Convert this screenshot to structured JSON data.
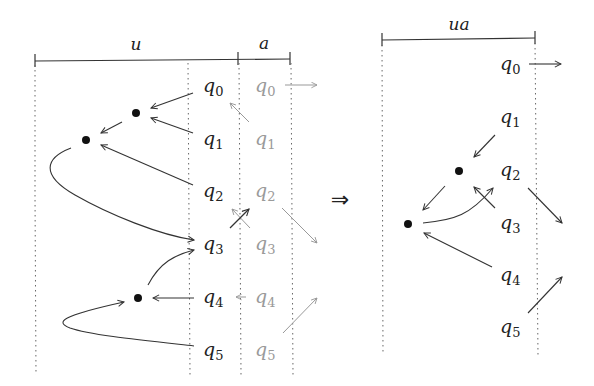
{
  "left_diagram": {
    "segments": [
      {
        "label": "u",
        "x1": 35,
        "x2": 238
      },
      {
        "label": "a",
        "x1": 238,
        "x2": 290
      }
    ],
    "states_u": [
      {
        "name": "q",
        "sub": "0",
        "x": 203,
        "y": 87
      },
      {
        "name": "q",
        "sub": "1",
        "x": 203,
        "y": 140
      },
      {
        "name": "q",
        "sub": "2",
        "x": 203,
        "y": 193
      },
      {
        "name": "q",
        "sub": "3",
        "x": 203,
        "y": 245
      },
      {
        "name": "q",
        "sub": "4",
        "x": 203,
        "y": 298
      },
      {
        "name": "q",
        "sub": "5",
        "x": 203,
        "y": 351
      }
    ],
    "states_a": [
      {
        "name": "q",
        "sub": "0",
        "x": 255,
        "y": 87
      },
      {
        "name": "q",
        "sub": "1",
        "x": 255,
        "y": 140
      },
      {
        "name": "q",
        "sub": "2",
        "x": 255,
        "y": 193
      },
      {
        "name": "q",
        "sub": "3",
        "x": 255,
        "y": 245
      },
      {
        "name": "q",
        "sub": "4",
        "x": 255,
        "y": 298
      },
      {
        "name": "q",
        "sub": "5",
        "x": 255,
        "y": 351
      }
    ]
  },
  "implies_symbol": "⇒",
  "right_diagram": {
    "segments": [
      {
        "label": "ua",
        "x1": 382,
        "x2": 535
      }
    ],
    "states": [
      {
        "name": "q",
        "sub": "0",
        "x": 500,
        "y": 67
      },
      {
        "name": "q",
        "sub": "1",
        "x": 500,
        "y": 120
      },
      {
        "name": "q",
        "sub": "2",
        "x": 500,
        "y": 172
      },
      {
        "name": "q",
        "sub": "3",
        "x": 500,
        "y": 225
      },
      {
        "name": "q",
        "sub": "4",
        "x": 500,
        "y": 278
      },
      {
        "name": "q",
        "sub": "5",
        "x": 500,
        "y": 330
      }
    ]
  }
}
